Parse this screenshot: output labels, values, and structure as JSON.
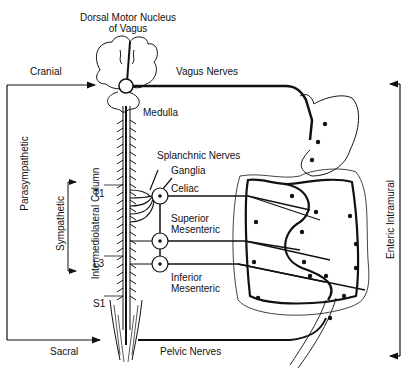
{
  "diagram": {
    "title_top": {
      "line1": "Dorsal Motor Nucleus",
      "line2": "of Vagus"
    },
    "labels": {
      "cranial": "Cranial",
      "vagus_nerves": "Vagus Nerves",
      "medulla": "Medulla",
      "splanchnic_nerves": "Splanchnic Nerves",
      "ganglia": "Ganglia",
      "celiac": "Celiac",
      "superior_mesenteric_1": "Superior",
      "superior_mesenteric_2": "Mesenteric",
      "inferior_mesenteric_1": "Inferior",
      "inferior_mesenteric_2": "Mesenteric",
      "t1": "T1",
      "l3": "L3",
      "s1": "S1",
      "sacral": "Sacral",
      "pelvic_nerves": "Pelvic Nerves"
    },
    "vertical_labels": {
      "parasympathetic": "Parasympathetic",
      "sympathetic": "Sympathetic",
      "intermediolateral_column": "Intermediolateral Column",
      "enteric_intramural": "Enteric Intramural"
    },
    "colors": {
      "line": "#111111",
      "background": "#ffffff"
    }
  }
}
